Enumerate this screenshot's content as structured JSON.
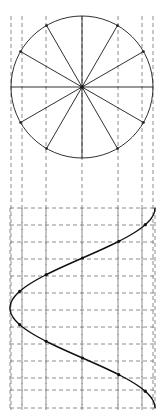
{
  "figure": {
    "width": 165,
    "height": 415,
    "background_color": "#ffffff",
    "stroke_color": "#1a1a1a",
    "grid_color": "#808080",
    "curve_color": "#111111"
  },
  "circle": {
    "name": "generating-circle",
    "center_x": 82,
    "center_y": 87,
    "radius": 71,
    "divisions": 12,
    "division_degrees": 30,
    "stroke_width": 0.9
  },
  "spokes": {
    "name": "radial-spokes",
    "count": 12,
    "angles_deg": [
      0,
      30,
      60,
      90,
      120,
      150,
      180,
      210,
      240,
      270,
      300,
      330
    ],
    "stroke_width": 0.9
  },
  "projection_lines": {
    "name": "circle-projection-lines",
    "description": "dashed vertical drop lines from circle division points",
    "x_positions": [
      11,
      22,
      46,
      82,
      118,
      142,
      153
    ],
    "top_y": 16,
    "bottom_y": 410,
    "dash": "4,3",
    "stroke_width": 0.9
  },
  "grid": {
    "name": "wave-dashed-grid",
    "vertical_x": [
      10,
      22,
      46,
      82,
      118,
      142,
      155
    ],
    "horizontal_y": [
      208,
      225,
      242,
      259,
      276,
      293,
      310,
      327,
      344,
      361,
      378,
      390,
      408
    ],
    "dash": "4,3",
    "stroke_width": 0.9,
    "left": 10,
    "right": 155,
    "top": 208,
    "bottom": 408
  },
  "chart_data": {
    "type": "line",
    "orientation": "vertical",
    "xlabel": "",
    "ylabel": "",
    "xlim": [
      10,
      155
    ],
    "ylim": [
      208,
      408
    ],
    "grid": true,
    "legend": null,
    "amplitude_px": 72.5,
    "midline_x": 82.5,
    "period_px": 200,
    "phase_start_deg": 90,
    "points": [
      {
        "deg": 0,
        "x": 155.0,
        "y": 208.0
      },
      {
        "deg": 30,
        "x": 145.3,
        "y": 224.7
      },
      {
        "deg": 60,
        "x": 118.8,
        "y": 241.3
      },
      {
        "deg": 90,
        "x": 82.5,
        "y": 258.0
      },
      {
        "deg": 120,
        "x": 46.2,
        "y": 274.7
      },
      {
        "deg": 150,
        "x": 19.7,
        "y": 291.3
      },
      {
        "deg": 180,
        "x": 10.0,
        "y": 308.0
      },
      {
        "deg": 210,
        "x": 19.7,
        "y": 324.7
      },
      {
        "deg": 240,
        "x": 46.2,
        "y": 341.3
      },
      {
        "deg": 270,
        "x": 82.5,
        "y": 358.0
      },
      {
        "deg": 300,
        "x": 118.8,
        "y": 374.7
      },
      {
        "deg": 330,
        "x": 145.3,
        "y": 391.3
      },
      {
        "deg": 360,
        "x": 155.0,
        "y": 408.0
      }
    ],
    "marker_points": [
      {
        "deg": 30,
        "x": 145.3,
        "y": 224.7
      },
      {
        "deg": 60,
        "x": 118.8,
        "y": 241.3
      },
      {
        "deg": 90,
        "x": 82.5,
        "y": 258.0
      },
      {
        "deg": 120,
        "x": 46.2,
        "y": 274.7
      },
      {
        "deg": 150,
        "x": 19.7,
        "y": 291.3
      },
      {
        "deg": 210,
        "x": 19.7,
        "y": 324.7
      },
      {
        "deg": 240,
        "x": 46.2,
        "y": 341.3
      },
      {
        "deg": 270,
        "x": 82.5,
        "y": 358.0
      },
      {
        "deg": 300,
        "x": 118.8,
        "y": 374.7
      },
      {
        "deg": 330,
        "x": 145.3,
        "y": 391.3
      }
    ],
    "marker_radius": 1.6,
    "curve_stroke_width": 1.4
  }
}
